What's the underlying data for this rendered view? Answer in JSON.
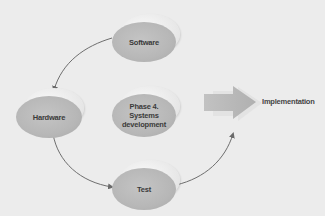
{
  "diagram": {
    "type": "cycle",
    "background_color": "#ececec",
    "node_color": "#b8b8b8",
    "arrow_color": "#6e6e6e",
    "nodes": [
      {
        "id": "software",
        "label": "Software"
      },
      {
        "id": "hardware",
        "label": "Hardware"
      },
      {
        "id": "phase4",
        "label_lines": [
          "Phase 4.",
          "Systems",
          "development"
        ]
      },
      {
        "id": "test",
        "label": "Test"
      }
    ],
    "output": {
      "label": "Implementation"
    },
    "edges": [
      {
        "from": "software",
        "to": "hardware"
      },
      {
        "from": "hardware",
        "to": "test"
      },
      {
        "from": "test",
        "to": "implementation"
      },
      {
        "from": "phase4",
        "to": "implementation",
        "style": "block-arrow"
      }
    ]
  }
}
